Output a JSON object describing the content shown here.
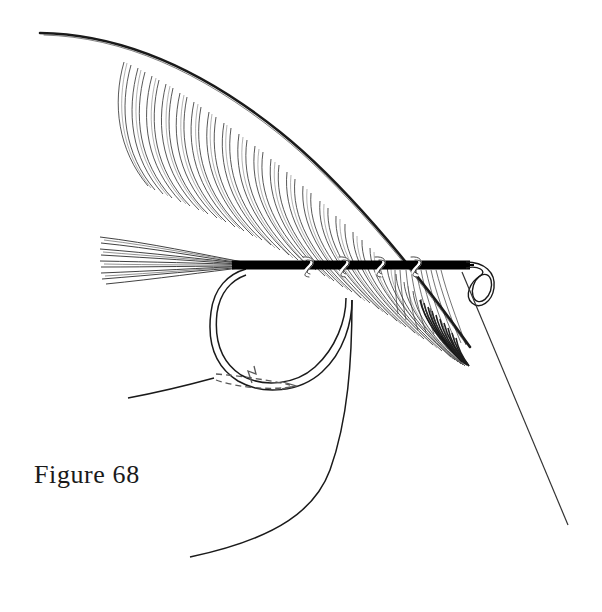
{
  "figure": {
    "caption": "Figure 68",
    "caption_number": 68,
    "background_color": "#ffffff",
    "ink_color": "#1a1a1a",
    "canvas": {
      "width": 602,
      "height": 612
    }
  },
  "elements": {
    "hook": {
      "name": "fishing hook",
      "shank_label": "hook shank",
      "bend_label": "hook bend",
      "point_label": "hook point",
      "line_color": "#1a1a1a",
      "shank_y": 265,
      "shank_start_x": 232,
      "shank_end_x": 470
    },
    "body": {
      "name": "thread body",
      "fill_color": "#000000",
      "start_x": 232,
      "end_x": 470,
      "thickness": 9
    },
    "ribbing": {
      "name": "open spiral rib",
      "loop_count": 4,
      "color": "#ffffff",
      "outline_color": "#1a1a1a",
      "start_x": 305,
      "end_x": 412
    },
    "tail": {
      "name": "tail fibers",
      "fiber_count": 9,
      "tip_x": 100,
      "root_x": 248
    },
    "feather": {
      "name": "hackle feather",
      "quill_label": "quill stem",
      "barb_label": "feather barbs",
      "barb_count": 46,
      "quill_tip_x": 40,
      "quill_tip_y": 33,
      "quill_end_x": 470,
      "quill_end_y": 345
    },
    "thread_loop": {
      "name": "thread loop at hook eye",
      "center_x": 481,
      "center_y": 285
    },
    "tying_thread": {
      "name": "tying thread",
      "from_eye_end_x": 568,
      "from_eye_end_y": 525,
      "bend_thread_end_x": 190,
      "bend_thread_end_y": 557,
      "left_thread_end_x": 128,
      "left_thread_end_y": 398
    },
    "motion_arrow": {
      "name": "dashed direction arrow",
      "style": "dashed",
      "direction": "right",
      "color": "#4a4a4a",
      "meaning": "direction of winding"
    }
  }
}
